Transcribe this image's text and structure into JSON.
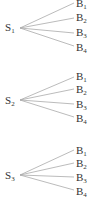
{
  "diagram": {
    "type": "tree",
    "line_color": "#aaaaaa",
    "text_color": "#333333",
    "groups": [
      {
        "source": {
          "base": "S",
          "sub": "1",
          "x": 5,
          "y": 22
        },
        "origin": [
          20,
          28
        ],
        "targets": [
          {
            "base": "B",
            "sub": "1",
            "x": 76,
            "y": -2,
            "end": [
              74,
              3
            ]
          },
          {
            "base": "B",
            "sub": "2",
            "x": 76,
            "y": 12,
            "end": [
              74,
              18
            ]
          },
          {
            "base": "B",
            "sub": "3",
            "x": 76,
            "y": 27,
            "end": [
              74,
              33
            ]
          },
          {
            "base": "B",
            "sub": "4",
            "x": 76,
            "y": 42,
            "end": [
              74,
              46
            ]
          }
        ]
      },
      {
        "source": {
          "base": "S",
          "sub": "2",
          "x": 5,
          "y": 95
        },
        "origin": [
          20,
          100
        ],
        "targets": [
          {
            "base": "B",
            "sub": "1",
            "x": 76,
            "y": 71,
            "end": [
              74,
              77
            ]
          },
          {
            "base": "B",
            "sub": "2",
            "x": 76,
            "y": 84,
            "end": [
              74,
              89
            ]
          },
          {
            "base": "B",
            "sub": "3",
            "x": 76,
            "y": 99,
            "end": [
              74,
              104
            ]
          },
          {
            "base": "B",
            "sub": "4",
            "x": 76,
            "y": 113,
            "end": [
              74,
              117
            ]
          }
        ]
      },
      {
        "source": {
          "base": "S",
          "sub": "3",
          "x": 5,
          "y": 170
        },
        "origin": [
          20,
          175
        ],
        "targets": [
          {
            "base": "B",
            "sub": "1",
            "x": 76,
            "y": 145,
            "end": [
              74,
              150
            ]
          },
          {
            "base": "B",
            "sub": "2",
            "x": 76,
            "y": 158,
            "end": [
              74,
              163
            ]
          },
          {
            "base": "B",
            "sub": "3",
            "x": 76,
            "y": 172,
            "end": [
              74,
              177
            ]
          },
          {
            "base": "B",
            "sub": "4",
            "x": 76,
            "y": 186,
            "end": [
              74,
              190
            ]
          }
        ]
      }
    ]
  }
}
